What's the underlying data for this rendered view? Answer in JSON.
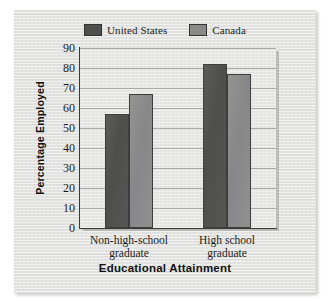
{
  "figure": {
    "background_color": "#ffffff",
    "panel_color": "#e3e3e1"
  },
  "legend": {
    "position": "top-center",
    "entries": [
      {
        "label": "United States",
        "color": "#4e4e4c",
        "icon": "legend-swatch-icon"
      },
      {
        "label": "Canada",
        "color": "#8a8a8a",
        "icon": "legend-swatch-icon"
      }
    ]
  },
  "chart_data": {
    "type": "bar",
    "title": "",
    "subtitle": "",
    "xlabel": "Educational Attainment",
    "ylabel": "Percentage Employed",
    "categories": [
      "Non-high-school graduate",
      "High school graduate"
    ],
    "category_lines": [
      [
        "Non-high-school",
        "graduate"
      ],
      [
        "High school",
        "graduate"
      ]
    ],
    "series": [
      {
        "name": "United States",
        "color": "#4e4e4c",
        "values": [
          57,
          82
        ]
      },
      {
        "name": "Canada",
        "color": "#8a8a8a",
        "values": [
          67,
          77
        ]
      }
    ],
    "ylim": [
      0,
      90
    ],
    "ytick_step": 10,
    "yticks": [
      90,
      80,
      70,
      60,
      50,
      40,
      30,
      20,
      10,
      0
    ],
    "ytick_labels": [
      "90",
      "80",
      "70",
      "60",
      "50",
      "40",
      "30",
      "20",
      "10",
      "0"
    ],
    "grid": true,
    "grid_axis": "y",
    "legend_position": "top-center",
    "bar_group_gap": true,
    "annotations": []
  }
}
